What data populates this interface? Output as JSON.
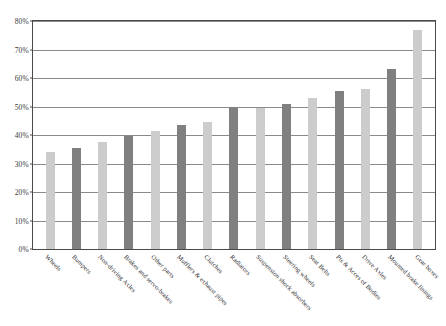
{
  "chart_data": {
    "type": "bar",
    "title": "",
    "xlabel": "",
    "ylabel": "",
    "ylim": [
      0,
      80
    ],
    "ytick_labels": [
      "80%",
      "70%",
      "60%",
      "50%",
      "40%",
      "30%",
      "20%",
      "10%",
      "0%"
    ],
    "ytick_values": [
      80,
      70,
      60,
      50,
      40,
      30,
      20,
      10,
      0
    ],
    "grid": true,
    "legend": "none",
    "categories": [
      "Wheels",
      "Bumpers",
      "Non-driving Axles",
      "Brakes and servo-brakes",
      "Other parts",
      "Mufflers & exhaust pipes",
      "Clutches",
      "Radiators",
      "Suspension shock absorbers",
      "Steering wheels",
      "Seat Belts",
      "Pts & Acces of Bodies",
      "Drive Axles",
      "Mounted brake linings",
      "Gear boxes"
    ],
    "values": [
      34,
      35.5,
      37.5,
      39.5,
      41.5,
      43.5,
      44.5,
      50,
      49.5,
      51,
      53,
      55.5,
      56,
      63,
      77
    ],
    "bar_colors": [
      "#cccccc",
      "#808080",
      "#cccccc",
      "#808080",
      "#cccccc",
      "#808080",
      "#cccccc",
      "#808080",
      "#cccccc",
      "#808080",
      "#cccccc",
      "#808080",
      "#cccccc",
      "#808080",
      "#cccccc"
    ],
    "colors": {
      "light_bar": "#cccccc",
      "dark_bar": "#808080",
      "axis": "#4a4a4a",
      "gridline": "#8a8a8a",
      "background": "#ffffff",
      "tick_text": "#3a3a3a"
    }
  }
}
